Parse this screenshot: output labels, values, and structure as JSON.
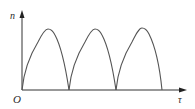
{
  "diagram": {
    "y_axis_label": "n",
    "x_axis_label": "τ",
    "origin_label": "O",
    "curve": {
      "description": "Three identical arches (rectified-sine-like pulses) starting and ending on the x-axis",
      "arch_count": 3,
      "stroke_color": "#555555"
    },
    "axis_color": "#333333"
  }
}
